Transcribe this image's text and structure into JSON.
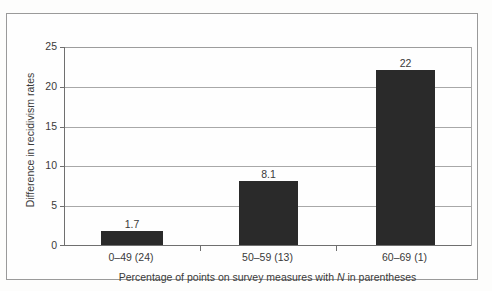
{
  "chart_data": {
    "type": "bar",
    "title": "",
    "subtitle": "",
    "categories": [
      "0–49 (24)",
      "50–59 (13)",
      "60–69 (1)"
    ],
    "values": [
      1.7,
      8.1,
      22
    ],
    "value_labels": [
      "1.7",
      "8.1",
      "22"
    ],
    "xlabel_prefix": "Percentage of points on survey measures with ",
    "xlabel_italic": "N",
    "xlabel_suffix": " in parentheses",
    "xlabel_full": "Percentage of points on survey measures with N in parentheses",
    "ylabel": "Difference in recidivism rates",
    "ylim": [
      0,
      25
    ],
    "yticks": [
      0,
      5,
      10,
      15,
      20,
      25
    ],
    "ytick_labels": [
      "0",
      "5",
      "10",
      "15",
      "20",
      "25"
    ],
    "grid": true,
    "grid_axis": "y",
    "legend": false,
    "bar_color": "#2a2a2a",
    "grid_color": "#a8a8a8",
    "axis_color": "#6f6f6f",
    "background_color": "#fefefe",
    "frame_border_color": "#9a9a9a"
  }
}
